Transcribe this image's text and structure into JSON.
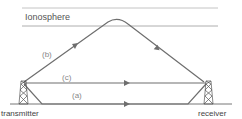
{
  "diagram": {
    "layer_label": "Ionosphere",
    "paths": [
      {
        "id": "a",
        "label": "(a)",
        "description": "ground wave"
      },
      {
        "id": "b",
        "label": "(b)",
        "description": "sky wave reflected by ionosphere"
      },
      {
        "id": "c",
        "label": "(c)",
        "description": "direct / line-of-sight wave"
      }
    ],
    "nodes": {
      "transmitter": "transmitter",
      "receiver": "receiver"
    },
    "colors": {
      "line": "#707070",
      "ionosphere": "#9a9a9a",
      "text": "#444444"
    }
  }
}
